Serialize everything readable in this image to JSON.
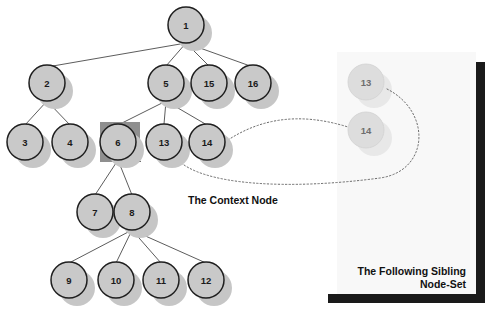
{
  "figure": {
    "background_color": "#ffffff",
    "node_fill": "#c9c9c9",
    "node_stroke": "#1f1f1f",
    "node_shadow": "#c0c0c0",
    "ghost_fill": "#dedede",
    "ghost_shadow": "#e6e6e6",
    "edge_color": "#4a4a4a",
    "highlight_color": "#8c8c8c",
    "panel_fill": "#f7f7f7",
    "panel_shadow": "#1a1a1a",
    "dotted_color": "#6b6b6b"
  },
  "tree": {
    "nodes": [
      {
        "id": "n1",
        "label": "1",
        "cx": 186,
        "cy": 25,
        "r": 18
      },
      {
        "id": "n2",
        "label": "2",
        "cx": 47,
        "cy": 83,
        "r": 18
      },
      {
        "id": "n5",
        "label": "5",
        "cx": 166,
        "cy": 83,
        "r": 18
      },
      {
        "id": "n15",
        "label": "15",
        "cx": 209,
        "cy": 83,
        "r": 18
      },
      {
        "id": "n16",
        "label": "16",
        "cx": 253,
        "cy": 83,
        "r": 18
      },
      {
        "id": "n3",
        "label": "3",
        "cx": 25,
        "cy": 142,
        "r": 18
      },
      {
        "id": "n4",
        "label": "4",
        "cx": 70,
        "cy": 142,
        "r": 18
      },
      {
        "id": "n6",
        "label": "6",
        "cx": 118,
        "cy": 142,
        "r": 18
      },
      {
        "id": "n13",
        "label": "13",
        "cx": 164,
        "cy": 142,
        "r": 18
      },
      {
        "id": "n14",
        "label": "14",
        "cx": 207,
        "cy": 142,
        "r": 18
      },
      {
        "id": "n7",
        "label": "7",
        "cx": 95,
        "cy": 212,
        "r": 18
      },
      {
        "id": "n8",
        "label": "8",
        "cx": 132,
        "cy": 212,
        "r": 18
      },
      {
        "id": "n9",
        "label": "9",
        "cx": 69,
        "cy": 280,
        "r": 18
      },
      {
        "id": "n10",
        "label": "10",
        "cx": 116,
        "cy": 280,
        "r": 18
      },
      {
        "id": "n11",
        "label": "11",
        "cx": 161,
        "cy": 280,
        "r": 18
      },
      {
        "id": "n12",
        "label": "12",
        "cx": 206,
        "cy": 280,
        "r": 18
      }
    ],
    "edges": [
      {
        "from": "n1",
        "to": "n2"
      },
      {
        "from": "n1",
        "to": "n5"
      },
      {
        "from": "n1",
        "to": "n15"
      },
      {
        "from": "n1",
        "to": "n16"
      },
      {
        "from": "n2",
        "to": "n3"
      },
      {
        "from": "n2",
        "to": "n4"
      },
      {
        "from": "n5",
        "to": "n6"
      },
      {
        "from": "n5",
        "to": "n13"
      },
      {
        "from": "n5",
        "to": "n14"
      },
      {
        "from": "n6",
        "to": "n7"
      },
      {
        "from": "n6",
        "to": "n8"
      },
      {
        "from": "n8",
        "to": "n9"
      },
      {
        "from": "n8",
        "to": "n10"
      },
      {
        "from": "n8",
        "to": "n11"
      },
      {
        "from": "n8",
        "to": "n12"
      }
    ],
    "context_node": {
      "id": "n6",
      "label": "6",
      "highlight_x": 100,
      "highlight_y": 122,
      "highlight_w": 40,
      "highlight_h": 40
    }
  },
  "ghost_nodes": [
    {
      "id": "g13",
      "label": "13",
      "cx": 366,
      "cy": 82,
      "r": 18
    },
    {
      "id": "g14",
      "label": "14",
      "cx": 366,
      "cy": 130,
      "r": 18
    }
  ],
  "connectors": [
    {
      "id": "c14",
      "from": "n14",
      "to": "g14"
    },
    {
      "id": "c13",
      "from": "n13",
      "to": "g13"
    }
  ],
  "panel": {
    "x": 337,
    "y": 52,
    "width": 139,
    "height": 242
  },
  "captions": {
    "context": "The Context Node",
    "following_sibling_line1": "The Following Sibling",
    "following_sibling_line2": "Node-Set"
  }
}
